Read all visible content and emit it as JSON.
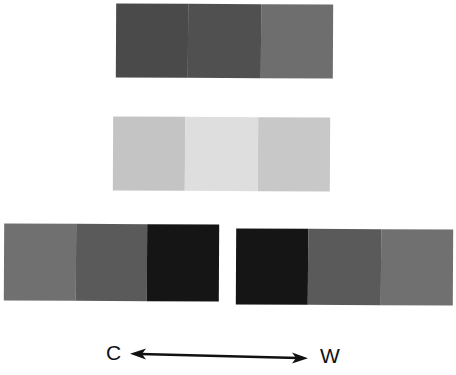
{
  "figure": {
    "strips": [
      {
        "id": "top",
        "patches": [
          {
            "color": "#4a4a4a"
          },
          {
            "color": "#505050"
          },
          {
            "color": "#6e6e6e"
          }
        ]
      },
      {
        "id": "middle",
        "patches": [
          {
            "color": "#c4c4c4"
          },
          {
            "color": "#dedede"
          },
          {
            "color": "#c8c8c8"
          }
        ]
      },
      {
        "id": "bottom-left",
        "patches": [
          {
            "color": "#707070"
          },
          {
            "color": "#5a5a5a"
          },
          {
            "color": "#151515"
          }
        ]
      },
      {
        "id": "bottom-right",
        "patches": [
          {
            "color": "#151515"
          },
          {
            "color": "#5a5a5a"
          },
          {
            "color": "#707070"
          }
        ]
      }
    ],
    "axis": {
      "left_label": "C",
      "right_label": "W",
      "arrow": "double-headed"
    }
  }
}
